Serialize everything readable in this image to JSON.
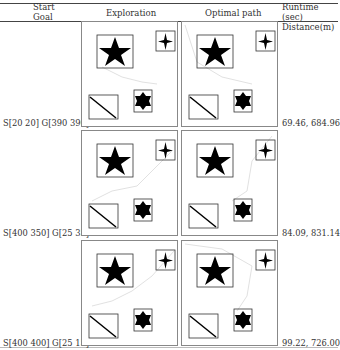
{
  "table": {
    "headers": {
      "start_goal": [
        "Start",
        "Goal"
      ],
      "exploration": "Exploration",
      "optimal_path": "Optimal path",
      "runtime_distance": [
        "Runtime (sec)",
        "Distance(m)"
      ]
    },
    "rows": [
      {
        "label": "S[20 20] G[390 390]",
        "result": "69.46, 684.96"
      },
      {
        "label": "S[400 350] G[25 35]",
        "result": "84.09, 831.14"
      },
      {
        "label": "S[400 400] G[25 15]",
        "result": "99.22, 726.00"
      }
    ]
  },
  "panel_icons": {
    "obstacles": [
      "star-obstacle-icon",
      "four-point-star-obstacle-icon",
      "diagonal-line-obstacle-icon",
      "six-point-star-obstacle-icon"
    ]
  }
}
